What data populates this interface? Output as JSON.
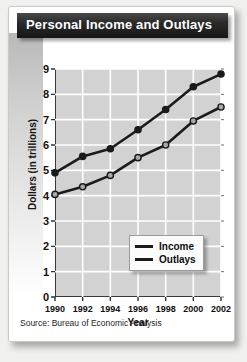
{
  "card": {
    "title": "Personal Income and Outlays",
    "source": "Source: Bureau of Economic Analysis"
  },
  "chart_data": {
    "type": "line",
    "title": "Personal Income and Outlays",
    "xlabel": "Year",
    "ylabel": "Dollars (in trillions)",
    "categories": [
      1990,
      1992,
      1994,
      1996,
      1998,
      2000,
      2002
    ],
    "x_tick_labels": [
      "1990",
      "1992",
      "1994",
      "1996",
      "1998",
      "2000",
      "2002"
    ],
    "y_tick_labels": [
      "0",
      "1",
      "2",
      "3",
      "4",
      "5",
      "6",
      "7",
      "8",
      "9"
    ],
    "y_ticks": [
      0,
      1,
      2,
      3,
      4,
      5,
      6,
      7,
      8,
      9
    ],
    "xlim": [
      1990,
      2002
    ],
    "ylim": [
      0,
      9
    ],
    "grid": true,
    "grid_color": "#ffffff",
    "plot_background": "#d2d2d2",
    "legend_position": "bottom-right-inside",
    "series": [
      {
        "name": "Income",
        "values": [
          4.9,
          5.55,
          5.85,
          6.6,
          7.4,
          8.3,
          8.8
        ],
        "color": "#1b1b1b",
        "marker_fill": "#1b1b1b"
      },
      {
        "name": "Outlays",
        "values": [
          4.05,
          4.35,
          4.8,
          5.5,
          6.0,
          6.95,
          7.5
        ],
        "color": "#1b1b1b",
        "marker_fill": "#a8a8a8"
      }
    ]
  }
}
